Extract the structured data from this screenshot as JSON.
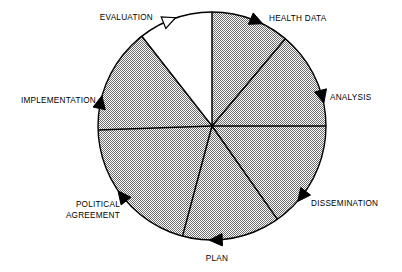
{
  "figure": {
    "name": "health-information-cycle-wheel",
    "type": "cyclical-process-wheel",
    "sector_count": 7,
    "background_color": "#ffffff",
    "outline_color": "#000000",
    "filled_sector_color": "#b2b2b2",
    "empty_sector_color": "#ffffff",
    "center": {
      "x": 212,
      "y": 126
    },
    "radius": 114
  },
  "chart_data": {
    "type": "pie",
    "title": "",
    "xlabel": "",
    "ylabel": "",
    "legend_position": "outside-labels",
    "grid": false,
    "categories": [
      "HEALTH DATA",
      "ANALYSIS",
      "DISSEMINATION",
      "PLAN",
      "POLITICAL AGREEMENT",
      "IMPLEMENTATION",
      "EVALUATION"
    ],
    "values": [
      40,
      50,
      55,
      50,
      73,
      50,
      42
    ],
    "colors": [
      "#b2b2b2",
      "#b2b2b2",
      "#b2b2b2",
      "#b2b2b2",
      "#b2b2b2",
      "#b2b2b2",
      "#ffffff"
    ]
  },
  "sectors": [
    {
      "id": "health-data",
      "label": "HEALTH DATA",
      "label_lines": [
        "HEALTH DATA"
      ],
      "filled": true,
      "fill_color": "#b2b2b2",
      "start_angle_deg": 90,
      "end_angle_deg": 50,
      "arrow_filled": true,
      "arrow_angle_deg": 67,
      "label_x": 269,
      "label_y": 21,
      "label_anchor": "start"
    },
    {
      "id": "analysis",
      "label": "ANALYSIS",
      "label_lines": [
        "ANALYSIS"
      ],
      "filled": true,
      "fill_color": "#b2b2b2",
      "start_angle_deg": 50,
      "end_angle_deg": 0,
      "arrow_filled": true,
      "arrow_angle_deg": 15,
      "label_x": 330,
      "label_y": 100,
      "label_anchor": "start"
    },
    {
      "id": "dissemination",
      "label": "DISSEMINATION",
      "label_lines": [
        "DISSEMINATION"
      ],
      "filled": true,
      "fill_color": "#b2b2b2",
      "start_angle_deg": 0,
      "end_angle_deg": -55,
      "arrow_filled": true,
      "arrow_angle_deg": -38,
      "label_x": 311,
      "label_y": 206,
      "label_anchor": "start"
    },
    {
      "id": "plan",
      "label": "PLAN",
      "label_lines": [
        "PLAN"
      ],
      "filled": true,
      "fill_color": "#b2b2b2",
      "start_angle_deg": -55,
      "end_angle_deg": -105,
      "arrow_filled": true,
      "arrow_angle_deg": -88,
      "label_x": 217,
      "label_y": 261,
      "label_anchor": "middle"
    },
    {
      "id": "political-agreement",
      "label": "POLITICAL AGREEMENT",
      "label_lines": [
        "POLITICAL",
        "AGREEMENT"
      ],
      "filled": true,
      "fill_color": "#b2b2b2",
      "start_angle_deg": -105,
      "end_angle_deg": -178,
      "arrow_filled": true,
      "arrow_angle_deg": -142,
      "label_x": 120,
      "label_y": 207,
      "label_anchor": "end"
    },
    {
      "id": "implementation",
      "label": "IMPLEMENTATION",
      "label_lines": [
        "IMPLEMENTATION"
      ],
      "filled": true,
      "fill_color": "#b2b2b2",
      "start_angle_deg": 182,
      "end_angle_deg": 128,
      "arrow_filled": true,
      "arrow_angle_deg": 168,
      "label_x": 96,
      "label_y": 103,
      "label_anchor": "end"
    },
    {
      "id": "evaluation",
      "label": "EVALUATION",
      "label_lines": [
        "EVALUATION"
      ],
      "filled": false,
      "fill_color": "#ffffff",
      "start_angle_deg": 128,
      "end_angle_deg": 90,
      "arrow_filled": false,
      "arrow_angle_deg": 112,
      "label_x": 153,
      "label_y": 20,
      "label_anchor": "end"
    }
  ]
}
